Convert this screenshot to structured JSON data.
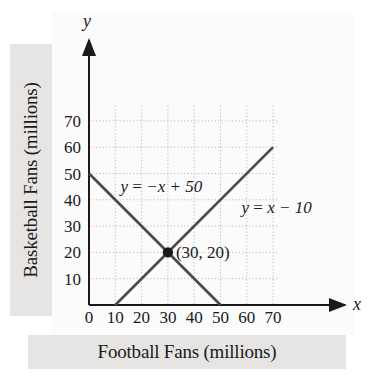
{
  "chart_data": {
    "type": "line",
    "title": "",
    "xlabel": "Football Fans (millions)",
    "ylabel": "Basketball Fans (millions)",
    "x_axis_name": "x",
    "y_axis_name": "y",
    "xlim": [
      0,
      75
    ],
    "ylim": [
      0,
      75
    ],
    "grid": true,
    "grid_style": "dotted",
    "legend": "none",
    "xticks": [
      0,
      10,
      20,
      30,
      40,
      50,
      60,
      70
    ],
    "xtick_labels": [
      "0",
      "10",
      "20",
      "30",
      "40",
      "50",
      "60",
      "70"
    ],
    "yticks": [
      10,
      20,
      30,
      40,
      50,
      60,
      70
    ],
    "ytick_labels": [
      "10",
      "20",
      "30",
      "40",
      "50",
      "60",
      "70"
    ],
    "series": [
      {
        "name": "y = −x + 50",
        "label": "y = −x + 50",
        "label_parts": {
          "lhs": "y",
          "eq": " = ",
          "rhs": "−x + 50"
        },
        "slope": -1,
        "intercept": 50,
        "x": [
          0,
          50
        ],
        "values": [
          50,
          0
        ],
        "label_x": 12,
        "label_y": 43
      },
      {
        "name": "y = x − 10",
        "label": "y = x − 10",
        "label_parts": {
          "lhs": "y",
          "eq": " = ",
          "rhs": "x − 10"
        },
        "slope": 1,
        "intercept": -10,
        "x": [
          10,
          70
        ],
        "values": [
          0,
          60
        ],
        "label_x": 58,
        "label_y": 35
      }
    ],
    "annotations": [
      {
        "name": "intersection-point",
        "label": "(30, 20)",
        "x": 30,
        "y": 20,
        "marker": "filled-circle"
      }
    ],
    "colors": {
      "line": "#4a4a4a",
      "axis": "#1a1a1a",
      "grid": "#bbbbbb",
      "panel": "#e6e5e3",
      "plot_background": "#fbfbfb",
      "text": "#1a1a1a"
    }
  }
}
